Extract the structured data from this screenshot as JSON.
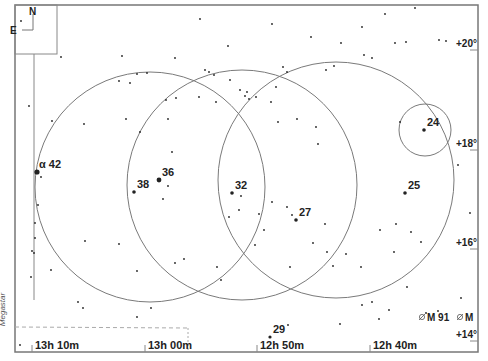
{
  "app": {
    "watermark": "Megastar"
  },
  "compass": {
    "north": "N",
    "east": "E"
  },
  "colors": {
    "frame": "#777777",
    "circle": "#7a7a7a",
    "star": "#222222",
    "text": "#222222",
    "background": "#ffffff"
  },
  "axes": {
    "ra_labels": [
      {
        "text": "13h 10m",
        "x": 35
      },
      {
        "text": "13h 00m",
        "x": 148
      },
      {
        "text": "12h 50m",
        "x": 260
      },
      {
        "text": "12h 40m",
        "x": 373
      }
    ],
    "dec_labels": [
      {
        "text": "+20°",
        "y": 47
      },
      {
        "text": "+18°",
        "y": 147
      },
      {
        "text": "+16°",
        "y": 246
      },
      {
        "text": "+14°",
        "y": 338
      }
    ]
  },
  "field_circles": [
    {
      "cx": 150,
      "cy": 187,
      "r": 115
    },
    {
      "cx": 242,
      "cy": 185,
      "r": 115
    },
    {
      "cx": 336,
      "cy": 180,
      "r": 118
    },
    {
      "cx": 425,
      "cy": 130,
      "r": 26
    }
  ],
  "labeled_stars": [
    {
      "label": "α 42",
      "x": 37,
      "y": 172,
      "size": 2.6
    },
    {
      "label": "36",
      "x": 159,
      "y": 180,
      "size": 2.4
    },
    {
      "label": "38",
      "x": 134,
      "y": 192,
      "size": 1.8
    },
    {
      "label": "32",
      "x": 232,
      "y": 193,
      "size": 1.8
    },
    {
      "label": "27",
      "x": 296,
      "y": 220,
      "size": 1.8
    },
    {
      "label": "25",
      "x": 405,
      "y": 193,
      "size": 1.8
    },
    {
      "label": "24",
      "x": 424,
      "y": 130,
      "size": 1.8
    },
    {
      "label": "29",
      "x": 270,
      "y": 337,
      "size": 1.6
    }
  ],
  "deep_sky": [
    {
      "label": "M 91",
      "x": 427,
      "y": 320
    },
    {
      "label": "M",
      "x": 465,
      "y": 320
    }
  ],
  "stars": [
    [
      21,
      21
    ],
    [
      61,
      57
    ],
    [
      122,
      56
    ],
    [
      200,
      19
    ],
    [
      272,
      24
    ],
    [
      385,
      14
    ],
    [
      415,
      8
    ],
    [
      439,
      40
    ],
    [
      406,
      42
    ],
    [
      228,
      46
    ],
    [
      175,
      58
    ],
    [
      311,
      37
    ],
    [
      341,
      43
    ],
    [
      364,
      55
    ],
    [
      372,
      58
    ],
    [
      205,
      70
    ],
    [
      209,
      72
    ],
    [
      199,
      97
    ],
    [
      214,
      75
    ],
    [
      230,
      80
    ],
    [
      240,
      90
    ],
    [
      245,
      96
    ],
    [
      247,
      92
    ],
    [
      249,
      99
    ],
    [
      256,
      97
    ],
    [
      216,
      102
    ],
    [
      166,
      100
    ],
    [
      176,
      98
    ],
    [
      130,
      83
    ],
    [
      168,
      119
    ],
    [
      147,
      73
    ],
    [
      137,
      74
    ],
    [
      119,
      81
    ],
    [
      326,
      70
    ],
    [
      362,
      27
    ],
    [
      395,
      43
    ],
    [
      334,
      66
    ],
    [
      283,
      67
    ],
    [
      287,
      72
    ],
    [
      276,
      87
    ],
    [
      271,
      102
    ],
    [
      278,
      122
    ],
    [
      297,
      119
    ],
    [
      316,
      127
    ],
    [
      318,
      144
    ],
    [
      400,
      122
    ],
    [
      446,
      41
    ],
    [
      458,
      165
    ],
    [
      470,
      213
    ],
    [
      37,
      172
    ],
    [
      41,
      177
    ],
    [
      38,
      205
    ],
    [
      29,
      106
    ],
    [
      52,
      121
    ],
    [
      84,
      124
    ],
    [
      126,
      119
    ],
    [
      140,
      132
    ],
    [
      172,
      152
    ],
    [
      168,
      186
    ],
    [
      163,
      199
    ],
    [
      241,
      196
    ],
    [
      239,
      210
    ],
    [
      229,
      217
    ],
    [
      272,
      202
    ],
    [
      287,
      207
    ],
    [
      292,
      215
    ],
    [
      259,
      214
    ],
    [
      264,
      230
    ],
    [
      255,
      245
    ],
    [
      290,
      267
    ],
    [
      313,
      243
    ],
    [
      325,
      224
    ],
    [
      333,
      266
    ],
    [
      327,
      252
    ],
    [
      346,
      254
    ],
    [
      361,
      267
    ],
    [
      380,
      230
    ],
    [
      394,
      252
    ],
    [
      411,
      232
    ],
    [
      421,
      242
    ],
    [
      396,
      224
    ],
    [
      407,
      287
    ],
    [
      389,
      310
    ],
    [
      372,
      302
    ],
    [
      362,
      305
    ],
    [
      34,
      253
    ],
    [
      35,
      238
    ],
    [
      35,
      223
    ],
    [
      32,
      251
    ],
    [
      51,
      270
    ],
    [
      31,
      277
    ],
    [
      85,
      241
    ],
    [
      119,
      244
    ],
    [
      137,
      271
    ],
    [
      78,
      302
    ],
    [
      83,
      308
    ],
    [
      151,
      308
    ],
    [
      137,
      317
    ],
    [
      175,
      263
    ],
    [
      184,
      259
    ],
    [
      217,
      267
    ],
    [
      221,
      280
    ],
    [
      288,
      325
    ],
    [
      340,
      324
    ],
    [
      379,
      319
    ],
    [
      426,
      313
    ],
    [
      20,
      345
    ],
    [
      461,
      298
    ]
  ]
}
